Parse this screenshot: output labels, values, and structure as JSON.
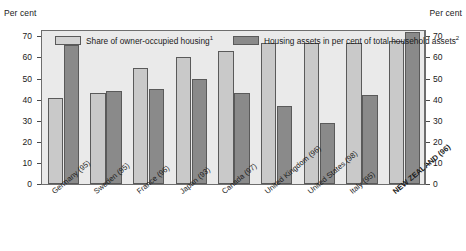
{
  "axis": {
    "unit_label_left": "Per cent",
    "unit_label_right": "Per cent",
    "yticks": [
      0,
      10,
      20,
      30,
      40,
      50,
      60,
      70
    ],
    "ymin": 0,
    "ymax": 73
  },
  "legend": {
    "series1_label": "Share of owner-occupied housing",
    "series1_footnote": "1",
    "series2_label": "Housing assets in per cent of total household assets",
    "series2_footnote": "2"
  },
  "colors": {
    "series1": "#c9c9c9",
    "series2": "#8a8a8a",
    "plot_background": "#eaeaea",
    "axis": "#6e6e6e",
    "text": "#1a1a1a"
  },
  "chart_data": {
    "type": "bar",
    "title": "",
    "xlabel": "",
    "ylabel": "Per cent",
    "ylim": [
      0,
      73
    ],
    "grid": false,
    "legend_position": "top-inside",
    "categories": [
      "Germany (95)",
      "Sweden (95)",
      "France (96)",
      "Japan (93)",
      "Canada (97)",
      "United Kingdom (96)",
      "United States (98)",
      "Italy (95)",
      "NEW ZEALAND (96)"
    ],
    "highlight_category": "NEW ZEALAND (96)",
    "series": [
      {
        "name": "Share of owner-occupied housing",
        "values": [
          41,
          43,
          55,
          60,
          63,
          67,
          67,
          67,
          68
        ]
      },
      {
        "name": "Housing assets in per cent of total household assets",
        "values": [
          66,
          44,
          45,
          50,
          43,
          37,
          29,
          42,
          72
        ]
      }
    ]
  }
}
